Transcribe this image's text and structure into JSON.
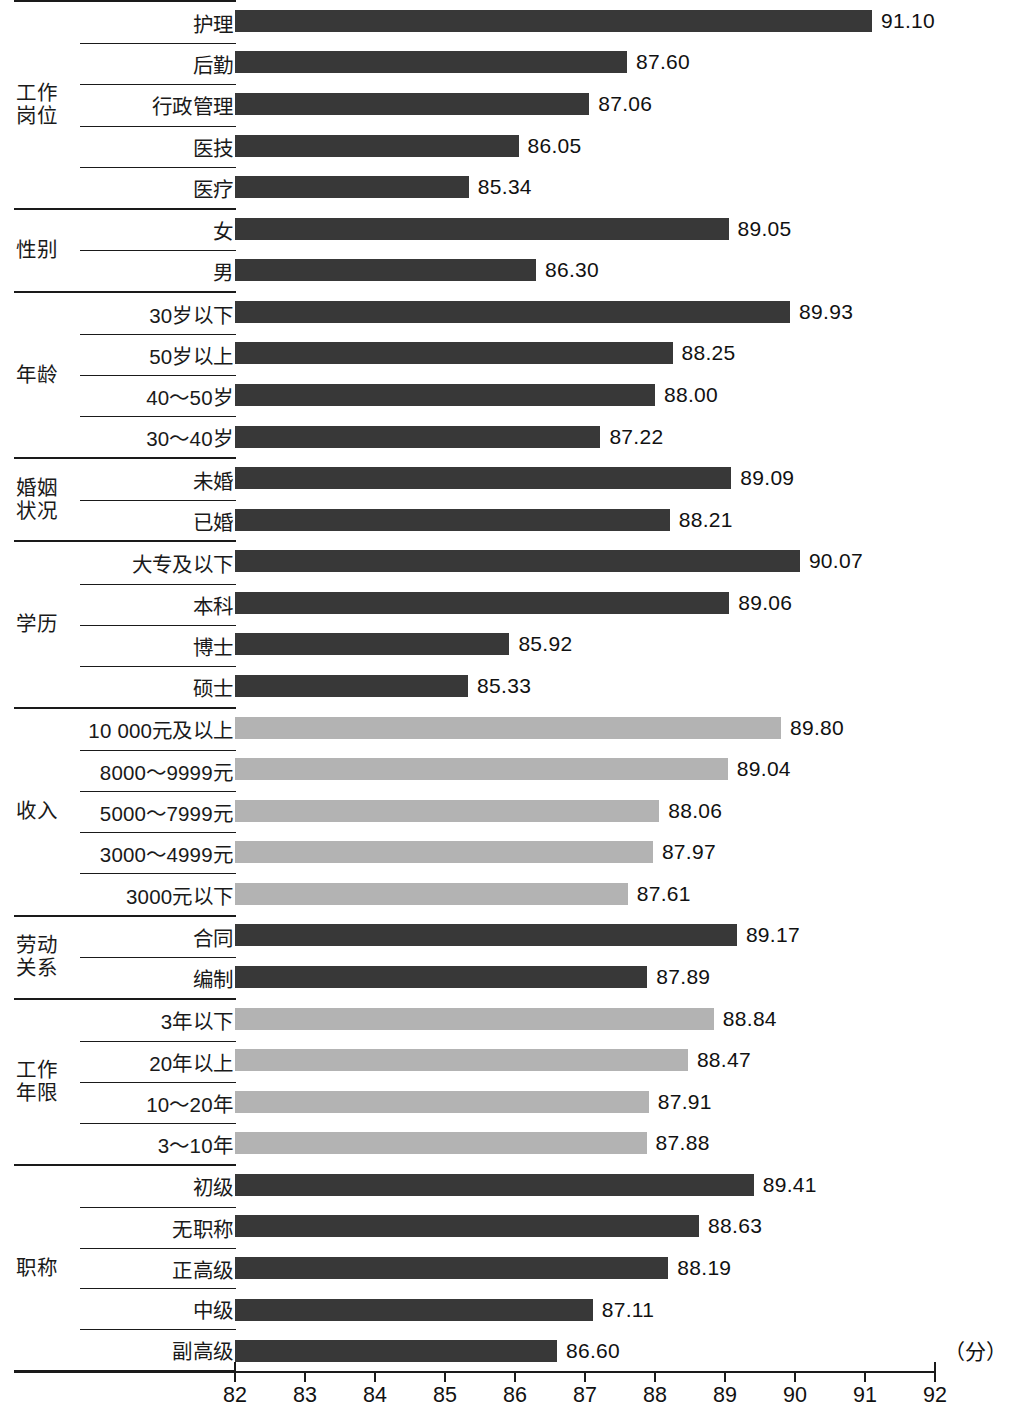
{
  "chart_data": {
    "type": "bar",
    "orientation": "horizontal",
    "title": "",
    "xlabel": "（分）",
    "ylabel": "",
    "xlim": [
      82,
      92
    ],
    "xticks": [
      "82",
      "83",
      "84",
      "85",
      "86",
      "87",
      "88",
      "89",
      "90",
      "91",
      "92"
    ],
    "grid": false,
    "legend": "none",
    "colors": {
      "dark_bar": "#383838",
      "light_bar": "#b3b3b3",
      "line": "#1a1a1a",
      "background": "#ffffff"
    },
    "groups": [
      {
        "name": "工作\n岗位",
        "shade": "dark",
        "categories": [
          "护理",
          "后勤",
          "行政管理",
          "医技",
          "医疗"
        ],
        "values": [
          91.1,
          87.6,
          87.06,
          86.05,
          85.34
        ],
        "labels": [
          "91.10",
          "87.60",
          "87.06",
          "86.05",
          "85.34"
        ]
      },
      {
        "name": "性别",
        "shade": "dark",
        "categories": [
          "女",
          "男"
        ],
        "values": [
          89.05,
          86.3
        ],
        "labels": [
          "89.05",
          "86.30"
        ]
      },
      {
        "name": "年龄",
        "shade": "dark",
        "categories": [
          "30岁以下",
          "50岁以上",
          "40～50岁",
          "30～40岁"
        ],
        "values": [
          89.93,
          88.25,
          88.0,
          87.22
        ],
        "labels": [
          "89.93",
          "88.25",
          "88.00",
          "87.22"
        ]
      },
      {
        "name": "婚姻\n状况",
        "shade": "dark",
        "categories": [
          "未婚",
          "已婚"
        ],
        "values": [
          89.09,
          88.21
        ],
        "labels": [
          "89.09",
          "88.21"
        ]
      },
      {
        "name": "学历",
        "shade": "dark",
        "categories": [
          "大专及以下",
          "本科",
          "博士",
          "硕士"
        ],
        "values": [
          90.07,
          89.06,
          85.92,
          85.33
        ],
        "labels": [
          "90.07",
          "89.06",
          "85.92",
          "85.33"
        ]
      },
      {
        "name": "收入",
        "shade": "light",
        "categories": [
          "10 000元及以上",
          "8000～9999元",
          "5000～7999元",
          "3000～4999元",
          "3000元以下"
        ],
        "values": [
          89.8,
          89.04,
          88.06,
          87.97,
          87.61
        ],
        "labels": [
          "89.80",
          "89.04",
          "88.06",
          "87.97",
          "87.61"
        ]
      },
      {
        "name": "劳动\n关系",
        "shade": "dark",
        "categories": [
          "合同",
          "编制"
        ],
        "values": [
          89.17,
          87.89
        ],
        "labels": [
          "89.17",
          "87.89"
        ]
      },
      {
        "name": "工作\n年限",
        "shade": "light",
        "categories": [
          "3年以下",
          "20年以上",
          "10～20年",
          "3～10年"
        ],
        "values": [
          88.84,
          88.47,
          87.91,
          87.88
        ],
        "labels": [
          "88.84",
          "88.47",
          "87.91",
          "87.88"
        ]
      },
      {
        "name": "职称",
        "shade": "dark",
        "categories": [
          "初级",
          "无职称",
          "正高级",
          "中级",
          "副高级"
        ],
        "values": [
          89.41,
          88.63,
          88.19,
          87.11,
          86.6
        ],
        "labels": [
          "89.41",
          "88.63",
          "88.19",
          "87.11",
          "86.60"
        ]
      }
    ]
  }
}
